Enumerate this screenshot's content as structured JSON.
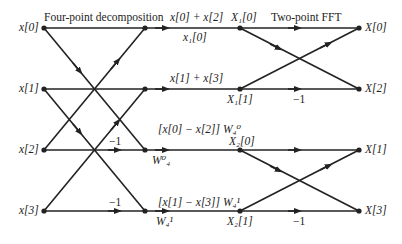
{
  "titles": {
    "stage1": "Four-point decomposition",
    "stage2": "Two-point FFT"
  },
  "inputs": [
    "x[0]",
    "x[1]",
    "x[2]",
    "x[3]"
  ],
  "outputs": [
    "X[0]",
    "X[2]",
    "X[1]",
    "X[3]"
  ],
  "intermediate": {
    "sum0": "x[0] + x[2]",
    "sum0_sub": "x₁[0]",
    "sum1": "x[1] + x[3]",
    "diff0": "[x[0] − x[2]] W₄⁰",
    "diff1": "[x[1] − x[3]] W₄¹",
    "tw0": "W⁰₄",
    "tw1": "W₄¹",
    "X1_0": "X₁[0]",
    "X1_1": "X₁[1]",
    "X2_0": "X₂[0]",
    "X2_1": "X₂[1]"
  },
  "gains": {
    "neg1_a": "−1",
    "neg1_b": "−1",
    "neg1_c": "−1",
    "neg1_d": "−1"
  },
  "colors": {
    "line": "#222222",
    "background": "#ffffff"
  }
}
